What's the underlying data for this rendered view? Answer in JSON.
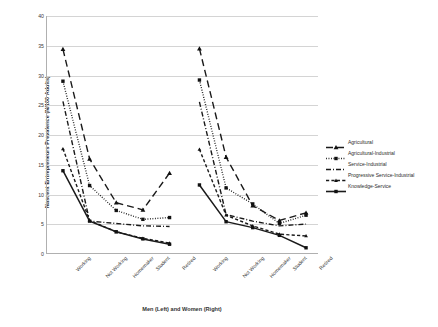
{
  "chart_data": {
    "type": "line",
    "title": "",
    "xlabel": "Men (Left) and Women (Right)",
    "ylabel": "Nascent Entrepreneurs Prevalence (N/100 Adults)",
    "ylim": [
      0,
      40
    ],
    "yticks": [
      0,
      5,
      10,
      15,
      20,
      25,
      30,
      35,
      40
    ],
    "grid": true,
    "legend_position": "right",
    "groups": [
      "Men (Left)",
      "Women (Right)"
    ],
    "categories": [
      "Working",
      "Not Working",
      "Homemaker",
      "Student",
      "Retired",
      "Working",
      "Not Working",
      "Homemaker",
      "Student",
      "Retired"
    ],
    "x_tick_labels": [
      "Working",
      "Not Working",
      "Homemaker",
      "Student",
      "Retired",
      "Working",
      "Not Working",
      "Homemaker",
      "Student",
      "Retired"
    ],
    "series": [
      {
        "name": "Agricultural",
        "line_style": "long-dash",
        "marker": "triangle",
        "color": "#1a1a1a",
        "values": [
          34.4,
          15.9,
          8.5,
          7.3,
          13.5,
          34.5,
          16.2,
          8.0,
          5.5,
          6.8
        ]
      },
      {
        "name": "Agricultural-Industrial",
        "line_style": "dotted",
        "marker": "square",
        "color": "#1a1a1a",
        "values": [
          29.0,
          11.4,
          7.2,
          5.7,
          6.0,
          29.2,
          11.0,
          8.3,
          5.0,
          6.4
        ]
      },
      {
        "name": "Service-Industrial",
        "line_style": "dash-dot",
        "marker": "none",
        "color": "#1a1a1a",
        "values": [
          25.6,
          5.4,
          5.0,
          4.6,
          4.5,
          25.5,
          6.5,
          5.4,
          4.6,
          4.9
        ]
      },
      {
        "name": "Progressive Service-Industrial",
        "line_style": "dashed",
        "marker": "triangle-small",
        "color": "#1a1a1a",
        "values": [
          17.6,
          5.5,
          3.6,
          2.5,
          1.7,
          17.5,
          6.4,
          4.6,
          3.2,
          2.9
        ]
      },
      {
        "name": "Knowledge-Service",
        "line_style": "solid",
        "marker": "square",
        "color": "#1a1a1a",
        "values": [
          13.9,
          5.4,
          3.6,
          2.4,
          1.5,
          11.5,
          5.3,
          4.3,
          3.0,
          0.9
        ]
      }
    ]
  },
  "legend": {
    "items": [
      {
        "label": "Agricultural"
      },
      {
        "label": "Agricultural-Industrial"
      },
      {
        "label": "Service-Industrial"
      },
      {
        "label": "Progressive Service-Industrial"
      },
      {
        "label": "Knowledge-Service"
      }
    ]
  }
}
